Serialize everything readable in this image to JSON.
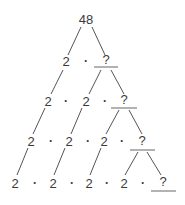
{
  "diagram": {
    "type": "factor-tree",
    "root": "48",
    "rows": [
      {
        "level": 1,
        "items": [
          "2",
          "·",
          "?"
        ]
      },
      {
        "level": 2,
        "items": [
          "2",
          "·",
          "2",
          "·",
          "?"
        ]
      },
      {
        "level": 3,
        "items": [
          "2",
          "·",
          "2",
          "·",
          "2",
          "·",
          "?"
        ]
      },
      {
        "level": 4,
        "items": [
          "2",
          "·",
          "2",
          "·",
          "2",
          "·",
          "2",
          "·",
          "?"
        ]
      }
    ],
    "colors": {
      "text": "#3a3a3a",
      "branch": "#555555",
      "underline": "#888888"
    }
  }
}
